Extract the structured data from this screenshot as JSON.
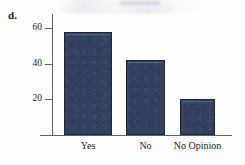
{
  "figure": {
    "item_letter": "d.",
    "background_color": "#fefefe",
    "axis_color": "#5d6168",
    "bar_fill_color": "#32415f",
    "bar_border_color": "#1e2738",
    "text_color": "#15171c"
  },
  "chart_data": {
    "type": "bar",
    "title": "",
    "subtitle": "",
    "xlabel": "",
    "ylabel": "",
    "categories": [
      "Yes",
      "No",
      "No Opinion"
    ],
    "values": [
      58,
      42,
      20
    ],
    "series": [
      {
        "name": "",
        "values": [
          58,
          42,
          20
        ]
      }
    ],
    "ylim": [
      0,
      68
    ],
    "yticks": [
      20,
      40,
      60
    ],
    "ytick_labels": [
      "20",
      "40",
      "60"
    ],
    "xticks": [],
    "grid": false,
    "legend": false,
    "legend_position": "none",
    "annotations": []
  }
}
